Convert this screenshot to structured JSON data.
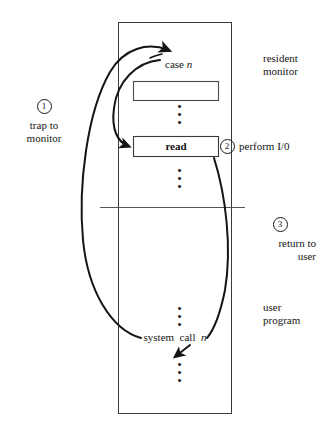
{
  "figure": {
    "background": "#ffffff",
    "line_color": "#1a1a1a",
    "text_color": "#151515"
  },
  "regions": {
    "resident_monitor": "resident\nmonitor",
    "user_program": "user\nprogram"
  },
  "steps": [
    {
      "number": "1",
      "label": "trap to\nmonitor"
    },
    {
      "number": "2",
      "label": "perform I/0"
    },
    {
      "number": "3",
      "label": "return to\nuser"
    }
  ],
  "nodes": {
    "case_label_text": "case ",
    "case_label_n": "n",
    "read_box_label": "read",
    "system_call_text": "system  call  ",
    "system_call_n": "n"
  },
  "ellipsis": {
    "glyph": "•",
    "groups": [
      {
        "name": "dots-monitor-upper"
      },
      {
        "name": "dots-monitor-lower"
      },
      {
        "name": "dots-user-upper"
      },
      {
        "name": "dots-user-lower"
      }
    ]
  }
}
